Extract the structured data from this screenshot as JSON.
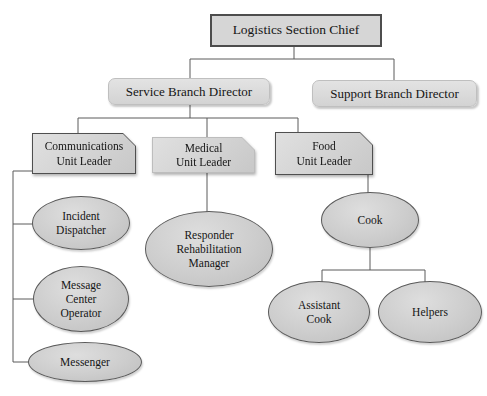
{
  "diagram": {
    "type": "org-chart",
    "colors": {
      "background": "#ffffff",
      "node_fill": "#d6d6d6",
      "node_fill_light": "#e0e0e0",
      "node_border_dark": "#4d4d4d",
      "node_border_soft": "#bfbfbf",
      "connector_line": "#5a5a5a",
      "text": "#151515"
    },
    "nodes": {
      "logistics_section_chief": {
        "label": "Logistics Section Chief",
        "shape": "rectangle",
        "level": 1
      },
      "service_branch_director": {
        "label": "Service Branch Director",
        "shape": "rounded-rectangle",
        "level": 2,
        "reports_to": "logistics_section_chief"
      },
      "support_branch_director": {
        "label": "Support Branch Director",
        "shape": "rounded-rectangle",
        "level": 2,
        "reports_to": "logistics_section_chief"
      },
      "communications_unit_leader": {
        "label": "Communications\nUnit Leader",
        "shape": "clipped-corner-rectangle",
        "level": 3,
        "reports_to": "service_branch_director"
      },
      "medical_unit_leader": {
        "label": "Medical\nUnit Leader",
        "shape": "clipped-corner-rectangle",
        "level": 3,
        "reports_to": "service_branch_director"
      },
      "food_unit_leader": {
        "label": "Food\nUnit Leader",
        "shape": "clipped-corner-rectangle",
        "level": 3,
        "reports_to": "service_branch_director"
      },
      "incident_dispatcher": {
        "label": "Incident\nDispatcher",
        "shape": "ellipse",
        "level": 4,
        "reports_to": "communications_unit_leader"
      },
      "message_center_operator": {
        "label": "Message\nCenter\nOperator",
        "shape": "ellipse",
        "level": 4,
        "reports_to": "communications_unit_leader"
      },
      "messenger": {
        "label": "Messenger",
        "shape": "ellipse",
        "level": 4,
        "reports_to": "communications_unit_leader"
      },
      "responder_rehabilitation_manager": {
        "label": "Responder\nRehabilitation\nManager",
        "shape": "ellipse",
        "level": 4,
        "reports_to": "medical_unit_leader"
      },
      "cook": {
        "label": "Cook",
        "shape": "ellipse",
        "level": 4,
        "reports_to": "food_unit_leader"
      },
      "assistant_cook": {
        "label": "Assistant\nCook",
        "shape": "ellipse",
        "level": 5,
        "reports_to": "cook"
      },
      "helpers": {
        "label": "Helpers",
        "shape": "ellipse",
        "level": 5,
        "reports_to": "cook"
      }
    },
    "edges": [
      [
        "logistics_section_chief",
        "service_branch_director"
      ],
      [
        "logistics_section_chief",
        "support_branch_director"
      ],
      [
        "service_branch_director",
        "communications_unit_leader"
      ],
      [
        "service_branch_director",
        "medical_unit_leader"
      ],
      [
        "service_branch_director",
        "food_unit_leader"
      ],
      [
        "communications_unit_leader",
        "incident_dispatcher"
      ],
      [
        "communications_unit_leader",
        "message_center_operator"
      ],
      [
        "communications_unit_leader",
        "messenger"
      ],
      [
        "medical_unit_leader",
        "responder_rehabilitation_manager"
      ],
      [
        "food_unit_leader",
        "cook"
      ],
      [
        "cook",
        "assistant_cook"
      ],
      [
        "cook",
        "helpers"
      ]
    ]
  }
}
